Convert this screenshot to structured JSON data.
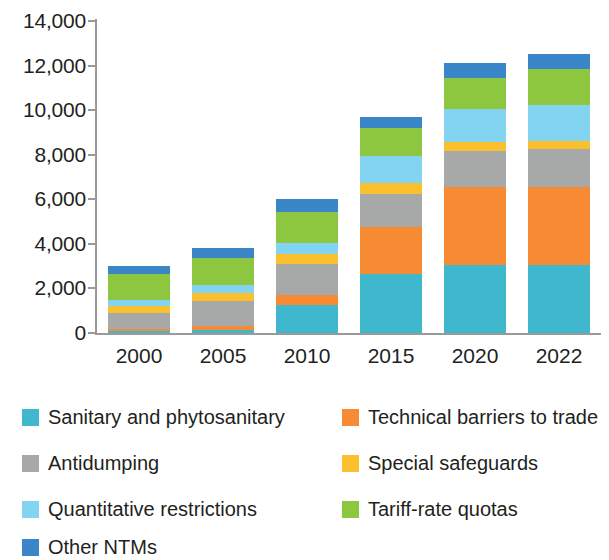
{
  "chart_data": {
    "type": "bar",
    "stacked": true,
    "title": "",
    "subtitle": "",
    "xlabel": "",
    "ylabel": "",
    "categories": [
      "2000",
      "2005",
      "2010",
      "2015",
      "2020",
      "2022"
    ],
    "ylim": [
      0,
      14000
    ],
    "ytick_values": [
      0,
      2000,
      4000,
      6000,
      8000,
      10000,
      12000,
      14000
    ],
    "ytick_labels": [
      "0",
      "2,000",
      "4,000",
      "6,000",
      "8,000",
      "10,000",
      "12,000",
      "14,000"
    ],
    "grid": false,
    "legend_position": "bottom",
    "series": [
      {
        "name": "Sanitary and phytosanitary",
        "color": "#3fb8ce",
        "values": [
          100,
          150,
          1250,
          2650,
          3050,
          3050
        ]
      },
      {
        "name": "Technical barriers to trade",
        "color": "#f68b33",
        "values": [
          100,
          150,
          450,
          2100,
          3500,
          3500
        ]
      },
      {
        "name": "Antidumping",
        "color": "#a7a9a9",
        "values": [
          700,
          1150,
          1400,
          1500,
          1600,
          1700
        ]
      },
      {
        "name": "Special safeguards",
        "color": "#fbc02d",
        "values": [
          300,
          350,
          450,
          500,
          400,
          350
        ]
      },
      {
        "name": "Quantitative restrictions",
        "color": "#82d4f0",
        "values": [
          300,
          350,
          500,
          1200,
          1500,
          1650
        ]
      },
      {
        "name": "Tariff-rate quotas",
        "color": "#8dc63f",
        "values": [
          1150,
          1200,
          1400,
          1250,
          1400,
          1600
        ]
      },
      {
        "name": "Other NTMs",
        "color": "#3a86c8",
        "values": [
          350,
          450,
          550,
          500,
          650,
          650
        ]
      }
    ],
    "totals": [
      3000,
      3800,
      6000,
      9700,
      12100,
      12500
    ]
  },
  "legend": {
    "items": [
      {
        "label": "Sanitary and phytosanitary",
        "color": "#3fb8ce"
      },
      {
        "label": "Technical barriers to trade",
        "color": "#f68b33"
      },
      {
        "label": "Antidumping",
        "color": "#a7a9a9"
      },
      {
        "label": "Special safeguards",
        "color": "#fbc02d"
      },
      {
        "label": "Quantitative restrictions",
        "color": "#82d4f0"
      },
      {
        "label": "Tariff-rate quotas",
        "color": "#8dc63f"
      },
      {
        "label": "Other NTMs",
        "color": "#3a86c8"
      }
    ]
  }
}
